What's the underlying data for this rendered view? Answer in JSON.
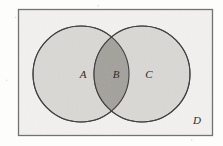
{
  "figure": {
    "kind": "venn-diagram",
    "sets": 2,
    "background_color": "#fdfdfc",
    "frame": {
      "label": "D",
      "label_name": "universal-set-label",
      "x": 18,
      "y": 9,
      "width": 195,
      "height": 127,
      "stroke_color": "#6f6f6f",
      "fill_color": "#f2f1ef",
      "label_x": 196,
      "label_y": 123
    },
    "circles": [
      {
        "label": "A",
        "label_name": "set-a-label",
        "cx": 81,
        "cy": 74,
        "r": 48,
        "stroke_color": "#4a4a4a",
        "fill_color": "#d8d7d3",
        "label_x": 83,
        "label_y": 78
      },
      {
        "label": "C",
        "label_name": "set-c-label",
        "cx": 142,
        "cy": 74,
        "r": 48,
        "stroke_color": "#4a4a4a",
        "fill_color": "#d8d7d3",
        "label_x": 149,
        "label_y": 78
      }
    ],
    "intersection": {
      "label": "B",
      "label_name": "intersection-label",
      "fill_color": "#9e9c97",
      "label_x": 116,
      "label_y": 78
    }
  }
}
